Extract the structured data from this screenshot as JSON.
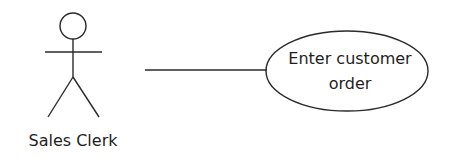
{
  "diagram": {
    "type": "UML use case diagram",
    "actor": {
      "label": "Sales Clerk",
      "icon": "stick-figure-icon"
    },
    "association": {
      "from": "Sales Clerk",
      "to": "Enter customer order"
    },
    "use_case": {
      "line1": "Enter customer",
      "line2": "order"
    }
  }
}
